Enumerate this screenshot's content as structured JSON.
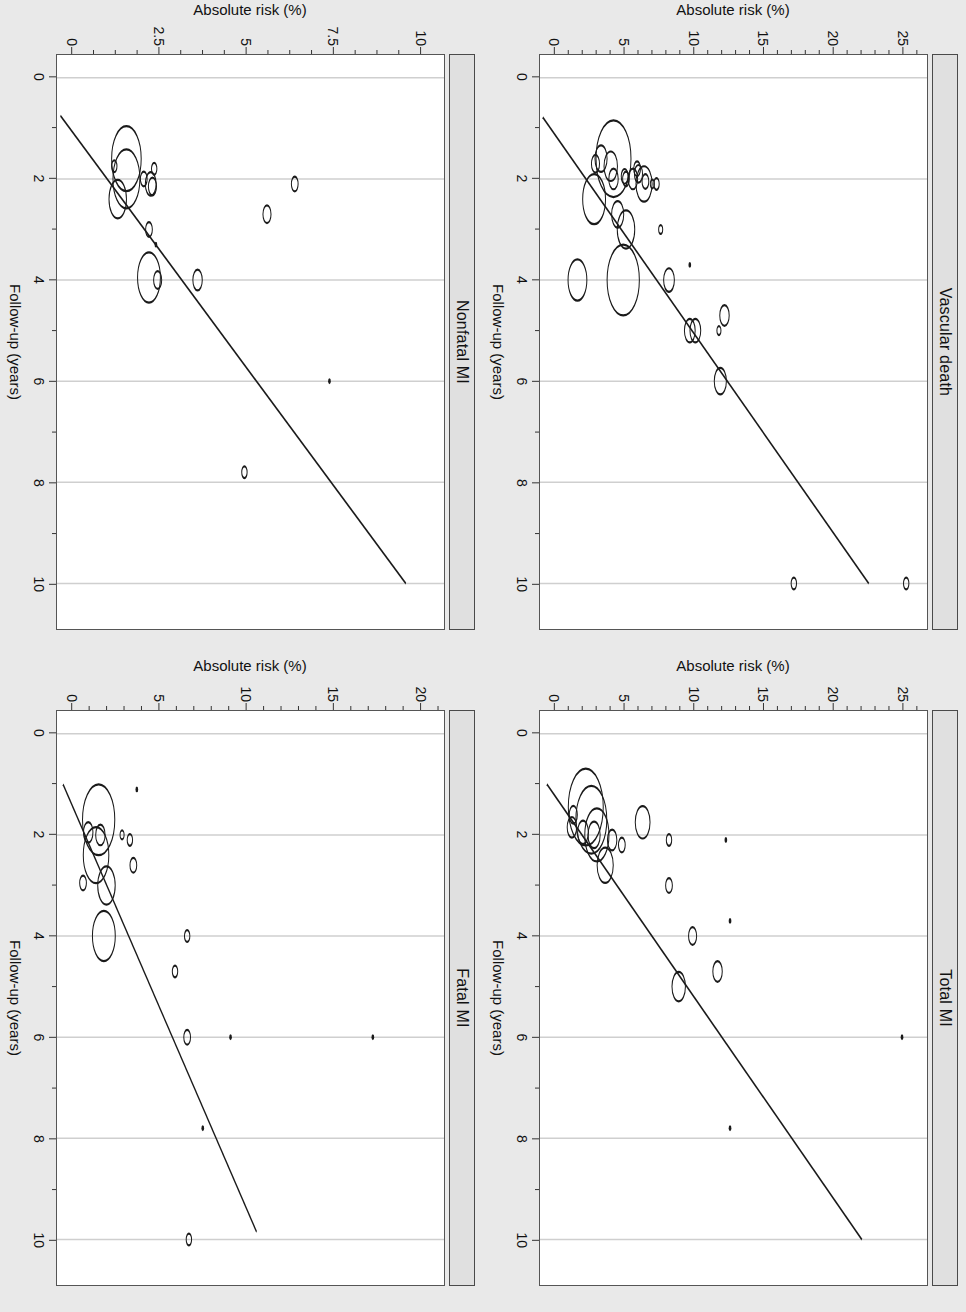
{
  "figure": {
    "orientation": "rotated-90-clockwise",
    "background_color": "#e9e9e9",
    "panel_background": "#ffffff",
    "strip_background": "#e0e0e0",
    "line_color": "#1a1a1a",
    "grid_color": "#cfcfcf"
  },
  "chart_data": [
    {
      "type": "scatter",
      "title": "Vascular death",
      "xlabel": "Follow-up (years)",
      "ylabel": "Absolute risk (%)",
      "xlim": [
        -0.45,
        10.9
      ],
      "ylim": [
        -1.1,
        26.8
      ],
      "xticks": [
        0,
        2,
        4,
        6,
        8,
        10
      ],
      "xtick_labels": [
        "0",
        "2",
        "4",
        "6",
        "8",
        "10"
      ],
      "xminorticks": [
        1,
        3,
        5,
        7,
        9
      ],
      "yticks": [
        0,
        5,
        10,
        15,
        20,
        25
      ],
      "ytick_labels": [
        "0",
        "5",
        "10",
        "15",
        "20",
        "25"
      ],
      "yminorticks": [
        1,
        2,
        3,
        4,
        6,
        7,
        8,
        9,
        11,
        12,
        13,
        14,
        16,
        17,
        18,
        19,
        21,
        22,
        23,
        24,
        26
      ],
      "grid": "vertical-only",
      "legend": "none",
      "fit_line": {
        "x0": 0.78,
        "y0": -0.9,
        "x1": 10.0,
        "y1": 22.6
      },
      "points": [
        {
          "x": 10.0,
          "y": 25.3,
          "r": 4
        },
        {
          "x": 10.0,
          "y": 17.2,
          "r": 4
        },
        {
          "x": 6.0,
          "y": 11.9,
          "r": 9
        },
        {
          "x": 5.0,
          "y": 11.8,
          "r": 3
        },
        {
          "x": 5.0,
          "y": 10.1,
          "r": 8
        },
        {
          "x": 5.0,
          "y": 9.7,
          "r": 8
        },
        {
          "x": 4.7,
          "y": 12.2,
          "r": 7
        },
        {
          "x": 4.0,
          "y": 8.2,
          "r": 8
        },
        {
          "x": 4.0,
          "y": 4.9,
          "r": 24
        },
        {
          "x": 4.0,
          "y": 1.6,
          "r": 14
        },
        {
          "x": 3.7,
          "y": 9.7,
          "r": 2
        },
        {
          "x": 3.0,
          "y": 7.6,
          "r": 3
        },
        {
          "x": 3.0,
          "y": 5.1,
          "r": 13
        },
        {
          "x": 2.7,
          "y": 4.5,
          "r": 9
        },
        {
          "x": 2.4,
          "y": 2.8,
          "r": 17
        },
        {
          "x": 2.1,
          "y": 7.3,
          "r": 4
        },
        {
          "x": 2.1,
          "y": 7.0,
          "r": 3
        },
        {
          "x": 2.1,
          "y": 6.4,
          "r": 12
        },
        {
          "x": 2.05,
          "y": 6.5,
          "r": 5
        },
        {
          "x": 2.0,
          "y": 5.6,
          "r": 7
        },
        {
          "x": 2.0,
          "y": 5.1,
          "r": 5
        },
        {
          "x": 2.0,
          "y": 4.2,
          "r": 7
        },
        {
          "x": 1.95,
          "y": 5.0,
          "r": 5
        },
        {
          "x": 1.9,
          "y": 6.0,
          "r": 6
        },
        {
          "x": 1.8,
          "y": 5.9,
          "r": 5
        },
        {
          "x": 1.75,
          "y": 4.0,
          "r": 10
        },
        {
          "x": 1.7,
          "y": 2.9,
          "r": 6
        },
        {
          "x": 1.6,
          "y": 4.2,
          "r": 26
        },
        {
          "x": 1.6,
          "y": 3.3,
          "r": 9
        }
      ]
    },
    {
      "type": "scatter",
      "title": "Total MI",
      "xlabel": "Follow-up (years)",
      "ylabel": "Absolute risk (%)",
      "xlim": [
        -0.45,
        10.9
      ],
      "ylim": [
        -1.1,
        26.8
      ],
      "xticks": [
        0,
        2,
        4,
        6,
        8,
        10
      ],
      "xtick_labels": [
        "0",
        "2",
        "4",
        "6",
        "8",
        "10"
      ],
      "xminorticks": [
        1,
        3,
        5,
        7,
        9
      ],
      "yticks": [
        0,
        5,
        10,
        15,
        20,
        25
      ],
      "ytick_labels": [
        "0",
        "5",
        "10",
        "15",
        "20",
        "25"
      ],
      "yminorticks": [
        1,
        2,
        3,
        4,
        6,
        7,
        8,
        9,
        11,
        12,
        13,
        14,
        16,
        17,
        18,
        19,
        21,
        22,
        23,
        24,
        26
      ],
      "grid": "vertical-only",
      "legend": "none",
      "fit_line": {
        "x0": 1.0,
        "y0": -0.6,
        "x1": 10.0,
        "y1": 22.1
      },
      "points": [
        {
          "x": 6.0,
          "y": 25.0,
          "r": 2
        },
        {
          "x": 7.8,
          "y": 12.6,
          "r": 2
        },
        {
          "x": 4.7,
          "y": 11.7,
          "r": 7
        },
        {
          "x": 5.0,
          "y": 8.9,
          "r": 10
        },
        {
          "x": 4.0,
          "y": 9.9,
          "r": 6
        },
        {
          "x": 3.7,
          "y": 12.6,
          "r": 2
        },
        {
          "x": 3.0,
          "y": 8.2,
          "r": 5
        },
        {
          "x": 2.6,
          "y": 3.6,
          "r": 12
        },
        {
          "x": 2.1,
          "y": 12.3,
          "r": 2
        },
        {
          "x": 2.1,
          "y": 8.2,
          "r": 4
        },
        {
          "x": 2.2,
          "y": 4.8,
          "r": 5
        },
        {
          "x": 2.1,
          "y": 4.1,
          "r": 7
        },
        {
          "x": 2.0,
          "y": 2.8,
          "r": 9
        },
        {
          "x": 2.0,
          "y": 3.0,
          "r": 18
        },
        {
          "x": 1.95,
          "y": 2.0,
          "r": 8
        },
        {
          "x": 1.85,
          "y": 1.2,
          "r": 7
        },
        {
          "x": 1.75,
          "y": 6.3,
          "r": 11
        },
        {
          "x": 1.7,
          "y": 2.6,
          "r": 23
        },
        {
          "x": 1.6,
          "y": 1.3,
          "r": 6
        },
        {
          "x": 1.45,
          "y": 2.2,
          "r": 26
        }
      ]
    },
    {
      "type": "scatter",
      "title": "Nonfatal MI",
      "xlabel": "Follow-up (years)",
      "ylabel": "Absolute risk (%)",
      "xlim": [
        -0.45,
        10.9
      ],
      "ylim": [
        -0.45,
        10.7
      ],
      "xticks": [
        0,
        2,
        4,
        6,
        8,
        10
      ],
      "xtick_labels": [
        "0",
        "2",
        "4",
        "6",
        "8",
        "10"
      ],
      "xminorticks": [
        1,
        3,
        5,
        7,
        9
      ],
      "yticks": [
        0,
        2.5,
        5,
        7.5,
        10
      ],
      "ytick_labels": [
        "0",
        "2.5",
        "5",
        "7.5",
        "10"
      ],
      "yminorticks": [
        0.625,
        1.25,
        1.875,
        3.125,
        3.75,
        4.375,
        5.625,
        6.25,
        6.875,
        8.125,
        8.75,
        9.375
      ],
      "grid": "vertical-only",
      "legend": "none",
      "fit_line": {
        "x0": 0.75,
        "y0": -0.35,
        "x1": 10.0,
        "y1": 9.6
      },
      "points": [
        {
          "x": 7.8,
          "y": 4.95,
          "r": 4
        },
        {
          "x": 6.0,
          "y": 7.4,
          "r": 2
        },
        {
          "x": 4.0,
          "y": 3.6,
          "r": 7
        },
        {
          "x": 4.0,
          "y": 2.45,
          "r": 6
        },
        {
          "x": 3.95,
          "y": 2.2,
          "r": 17
        },
        {
          "x": 3.3,
          "y": 2.4,
          "r": 2
        },
        {
          "x": 3.0,
          "y": 2.2,
          "r": 5
        },
        {
          "x": 2.7,
          "y": 5.6,
          "r": 6
        },
        {
          "x": 2.4,
          "y": 1.3,
          "r": 13
        },
        {
          "x": 2.1,
          "y": 6.4,
          "r": 5
        },
        {
          "x": 2.15,
          "y": 2.3,
          "r": 6
        },
        {
          "x": 2.1,
          "y": 2.25,
          "r": 8
        },
        {
          "x": 2.0,
          "y": 2.05,
          "r": 5
        },
        {
          "x": 2.0,
          "y": 1.55,
          "r": 20
        },
        {
          "x": 1.8,
          "y": 2.35,
          "r": 4
        },
        {
          "x": 1.75,
          "y": 1.2,
          "r": 4
        },
        {
          "x": 1.6,
          "y": 1.55,
          "r": 22
        }
      ]
    },
    {
      "type": "scatter",
      "title": "Fatal MI",
      "xlabel": "Follow-up (years)",
      "ylabel": "Absolute risk (%)",
      "xlim": [
        -0.45,
        10.9
      ],
      "ylim": [
        -0.9,
        21.4
      ],
      "xticks": [
        0,
        2,
        4,
        6,
        8,
        10
      ],
      "xtick_labels": [
        "0",
        "2",
        "4",
        "6",
        "8",
        "10"
      ],
      "xminorticks": [
        1,
        3,
        5,
        7,
        9
      ],
      "yticks": [
        0,
        5,
        10,
        15,
        20
      ],
      "ytick_labels": [
        "0",
        "5",
        "10",
        "15",
        "20"
      ],
      "yminorticks": [
        1,
        2,
        3,
        4,
        6,
        7,
        8,
        9,
        11,
        12,
        13,
        14,
        16,
        17,
        18,
        19,
        21
      ],
      "grid": "vertical-only",
      "legend": "none",
      "fit_line": {
        "x0": 1.0,
        "y0": -0.55,
        "x1": 9.85,
        "y1": 10.6
      },
      "points": [
        {
          "x": 10.0,
          "y": 6.7,
          "r": 4
        },
        {
          "x": 7.8,
          "y": 7.5,
          "r": 2
        },
        {
          "x": 6.0,
          "y": 17.3,
          "r": 2
        },
        {
          "x": 6.0,
          "y": 9.1,
          "r": 2
        },
        {
          "x": 6.0,
          "y": 6.6,
          "r": 5
        },
        {
          "x": 4.7,
          "y": 5.9,
          "r": 4
        },
        {
          "x": 4.0,
          "y": 6.6,
          "r": 4
        },
        {
          "x": 4.0,
          "y": 1.8,
          "r": 17
        },
        {
          "x": 3.0,
          "y": 1.95,
          "r": 13
        },
        {
          "x": 2.95,
          "y": 0.6,
          "r": 5
        },
        {
          "x": 2.6,
          "y": 3.5,
          "r": 5
        },
        {
          "x": 2.4,
          "y": 1.35,
          "r": 19
        },
        {
          "x": 2.1,
          "y": 3.3,
          "r": 4
        },
        {
          "x": 2.0,
          "y": 2.85,
          "r": 3
        },
        {
          "x": 2.0,
          "y": 1.6,
          "r": 7
        },
        {
          "x": 1.95,
          "y": 0.9,
          "r": 7
        },
        {
          "x": 1.7,
          "y": 1.5,
          "r": 24
        },
        {
          "x": 1.1,
          "y": 3.7,
          "r": 2
        }
      ]
    }
  ]
}
